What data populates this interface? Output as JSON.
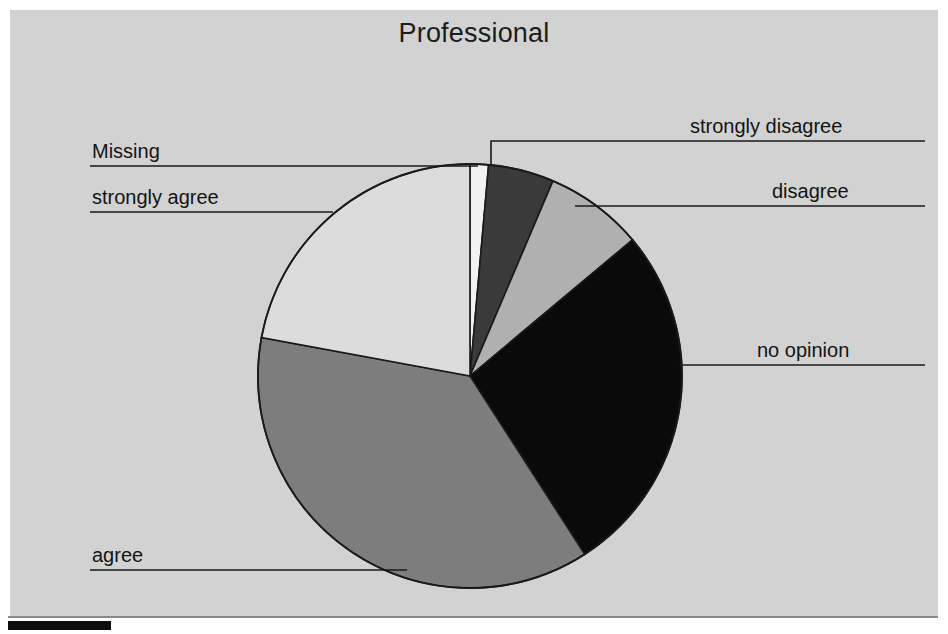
{
  "chart": {
    "title": "Professional",
    "background_color": "#d2d2d2",
    "outer_background_color": "#ffffff"
  },
  "chart_data": {
    "type": "pie",
    "title": "Professional",
    "xlabel": "",
    "ylabel": "",
    "legend_position": "callout-labels",
    "grid": false,
    "start_angle_deg": 0,
    "direction": "clockwise",
    "categories": [
      "Missing",
      "strongly disagree",
      "disagree",
      "no opinion",
      "agree",
      "strongly agree"
    ],
    "values": [
      1.4,
      5.0,
      7.5,
      27.0,
      37.0,
      22.1
    ],
    "colors": [
      "#f2f2f2",
      "#3a3a3a",
      "#b0b0b0",
      "#0a0a0a",
      "#7d7d7d",
      "#dcdcdc"
    ],
    "labels": [
      {
        "name": "Missing",
        "value": 1.4,
        "color": "#f2f2f2",
        "side": "left"
      },
      {
        "name": "strongly disagree",
        "value": 5.0,
        "color": "#3a3a3a",
        "side": "right"
      },
      {
        "name": "disagree",
        "value": 7.5,
        "color": "#b0b0b0",
        "side": "right"
      },
      {
        "name": "no opinion",
        "value": 27.0,
        "color": "#0a0a0a",
        "side": "right"
      },
      {
        "name": "agree",
        "value": 37.0,
        "color": "#7d7d7d",
        "side": "left"
      },
      {
        "name": "strongly agree",
        "value": 22.1,
        "color": "#dcdcdc",
        "side": "left"
      }
    ]
  },
  "callouts": {
    "strongly_disagree": "strongly disagree",
    "disagree": "disagree",
    "no_opinion": "no opinion",
    "agree": "agree",
    "strongly_agree": "strongly agree",
    "missing": "Missing"
  }
}
